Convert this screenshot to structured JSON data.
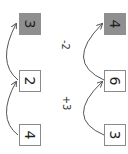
{
  "diagram": {
    "orientation": "rotated-90",
    "columns": [
      {
        "boxes": [
          {
            "value": "3",
            "filled": true
          },
          {
            "value": "2",
            "filled": false
          },
          {
            "value": "4",
            "filled": false
          }
        ],
        "arcs": [
          {
            "label": ""
          },
          {
            "label": ""
          }
        ]
      },
      {
        "boxes": [
          {
            "value": "4",
            "filled": true
          },
          {
            "value": "6",
            "filled": false
          },
          {
            "value": "3",
            "filled": false
          }
        ],
        "arcs": [
          {
            "label": "-2"
          },
          {
            "label": "+3"
          }
        ]
      }
    ],
    "colors": {
      "filled_box": "#8f8f8f",
      "border": "#8a8a8a",
      "arc": "#555555"
    }
  }
}
